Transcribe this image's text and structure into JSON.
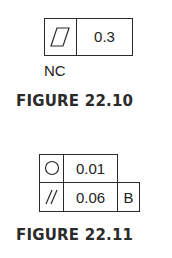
{
  "figure_1": {
    "frame": {
      "symbol": "flatness-icon",
      "tolerance": "0.3"
    },
    "modifier": "NC",
    "caption": "FIGURE 22.10"
  },
  "figure_2": {
    "rows": [
      {
        "symbol": "circularity-icon",
        "tolerance": "0.01",
        "datum": ""
      },
      {
        "symbol": "parallelism-icon",
        "tolerance": "0.06",
        "datum": "B"
      }
    ],
    "caption": "FIGURE 22.11"
  }
}
